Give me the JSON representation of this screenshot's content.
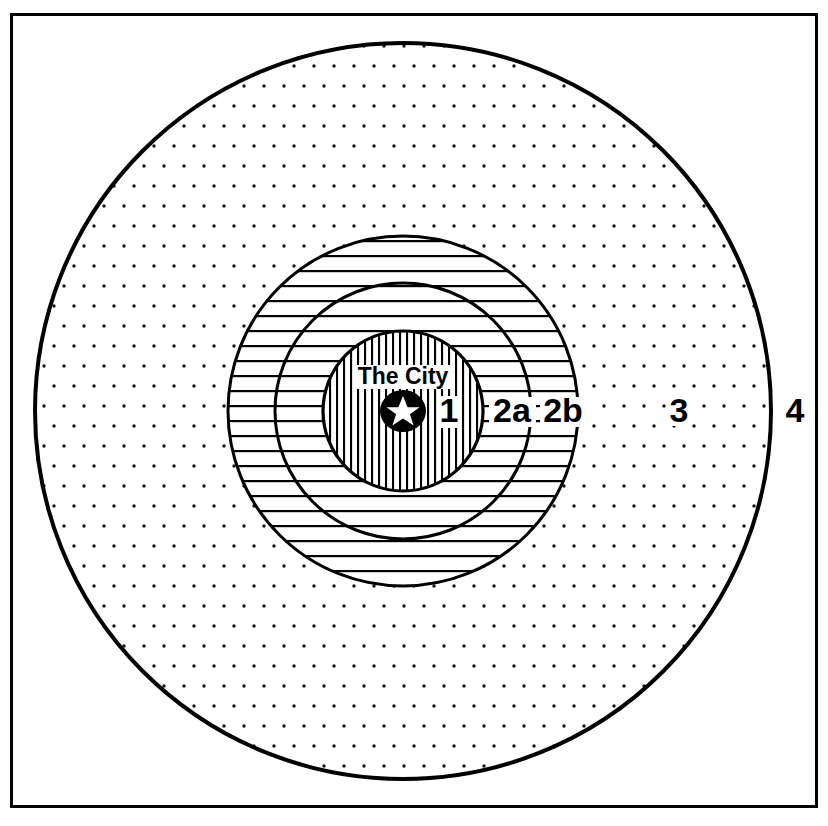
{
  "figure": {
    "frame": {
      "stroke_color": "#000000",
      "x": 10,
      "y": 13,
      "width": 808,
      "height": 795,
      "stroke_width": 3
    },
    "center": {
      "x": 403,
      "y": 411
    },
    "background_color": "#ffffff",
    "ink_color": "#000000"
  },
  "center_marker": {
    "label": "The City",
    "icon": "star-in-circle",
    "circle_radius": 22,
    "star_color": "#ffffff",
    "disc_color": "#000000",
    "label_x": 403,
    "label_y": 381,
    "disc_x": 403,
    "disc_y": 411
  },
  "zones": [
    {
      "id": "zone-1",
      "label": "1",
      "radius": 80,
      "fill_pattern": "vertical-lines",
      "label_x": 449,
      "label_y": 420,
      "stroke_width": 3
    },
    {
      "id": "zone-2a",
      "label": "2a",
      "radius": 128,
      "fill_pattern": "horizontal-lines",
      "label_x": 513,
      "label_y": 420,
      "stroke_width": 3
    },
    {
      "id": "zone-2b",
      "label": "2b",
      "radius": 175,
      "fill_pattern": "horizontal-lines",
      "label_x": 563,
      "label_y": 420,
      "stroke_width": 3
    },
    {
      "id": "zone-3",
      "label": "3",
      "radius": 368,
      "fill_pattern": "dot-grid",
      "label_x": 679,
      "label_y": 420,
      "stroke_width": 4
    },
    {
      "id": "zone-4",
      "label": "4",
      "radius": null,
      "fill_pattern": "none",
      "label_x": 795,
      "label_y": 420,
      "stroke_width": 0
    }
  ],
  "patterns": {
    "vertical_lines": {
      "spacing": 7,
      "stroke_width": 2
    },
    "horizontal_lines": {
      "spacing": 15,
      "stroke_width": 2
    },
    "dot_grid": {
      "spacing": 20,
      "dot_radius": 1.6
    }
  },
  "label_font_size": 34,
  "city_font_size": 23
}
